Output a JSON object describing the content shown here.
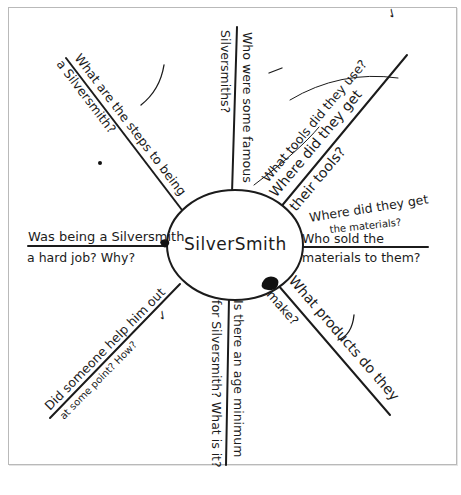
{
  "diagram": {
    "type": "spider-map",
    "medium": "handwritten on paper",
    "center": {
      "label": "SilverSmith"
    },
    "spokes": [
      {
        "id": "top-left",
        "text_line1": "What are the steps to being",
        "text_line2": "a Silversmith?"
      },
      {
        "id": "top",
        "text_line1": "Who were some famous",
        "text_line2": "Silversmiths?"
      },
      {
        "id": "top-right-upper",
        "text_line1": "What tools did they use?",
        "check": "✓"
      },
      {
        "id": "top-right",
        "text_line1": "Where did they get",
        "text_line2": "their tools?"
      },
      {
        "id": "right-upper",
        "text_line1": "Where did they get",
        "text_line2": "the materials?"
      },
      {
        "id": "right",
        "text_line1": "Who sold the",
        "text_line2": "materials to them?"
      },
      {
        "id": "bottom-right",
        "text_line1": "What products do they",
        "text_line2": "make?"
      },
      {
        "id": "bottom",
        "text_line1": "Is there an age minimum",
        "text_line2": "for Silversmith? What is it?"
      },
      {
        "id": "bottom-left",
        "text_line1": "Did someone help him out",
        "text_line2": "at some point? How?",
        "check": "✓"
      },
      {
        "id": "left",
        "text_line1": "Was being a Silversmith",
        "text_line2": "a hard job? Why?"
      }
    ],
    "colors": {
      "ink": "#1b1b1b",
      "paper": "#ffffff",
      "border": "#b9b9b9"
    }
  }
}
